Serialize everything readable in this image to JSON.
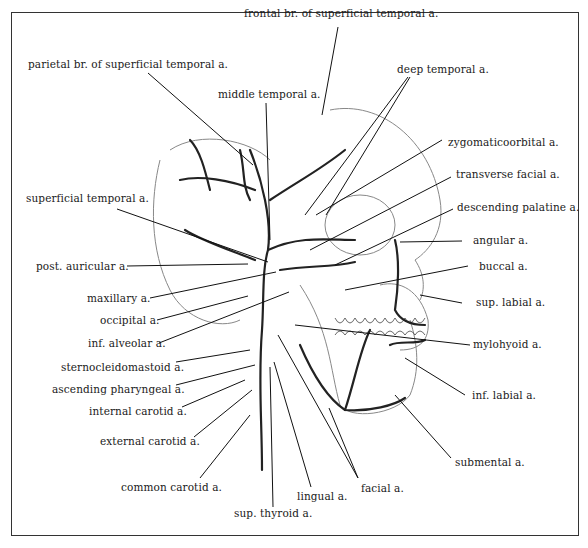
{
  "figure": {
    "labels": {
      "frontal_br": "frontal br. of superficial temporal a.",
      "parietal_br": "parietal br. of superficial temporal a.",
      "deep_temporal": "deep temporal a.",
      "middle_temporal": "middle temporal a.",
      "zygomaticoorbital": "zygomaticoorbital a.",
      "superficial_temporal": "superficial temporal a.",
      "transverse_facial": "transverse facial a.",
      "descending_palatine": "descending palatine a.",
      "angular": "angular a.",
      "post_auricular": "post. auricular a.",
      "buccal": "buccal a.",
      "maxillary": "maxillary a.",
      "sup_labial": "sup. labial a.",
      "occipital": "occipital a.",
      "inf_alveolar": "inf. alveolar a.",
      "mylohyoid": "mylohyoid a.",
      "sternocleidomastoid": "sternocleidomastoid a.",
      "ascending_pharyngeal": "ascending pharyngeal a.",
      "inf_labial": "inf. labial a.",
      "internal_carotid": "internal carotid a.",
      "external_carotid": "external carotid a.",
      "submental": "submental a.",
      "common_carotid": "common carotid a.",
      "facial": "facial a.",
      "lingual": "lingual a.",
      "sup_thyroid": "sup. thyroid a."
    },
    "colors": {
      "ink": "#1a1a1a",
      "sketch": "#777777",
      "background": "#ffffff"
    }
  }
}
